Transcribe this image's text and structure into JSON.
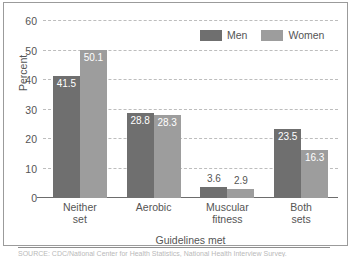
{
  "chart_data": {
    "type": "bar",
    "title": "",
    "xlabel": "Guidelines met",
    "ylabel": "Percent",
    "ylim": [
      0,
      60
    ],
    "yticks": [
      0,
      10,
      20,
      30,
      40,
      50,
      60
    ],
    "grid": true,
    "legend_position": "top-right",
    "categories": [
      "Neither set",
      "Aerobic",
      "Muscular fitness",
      "Both sets"
    ],
    "category_lines": [
      [
        "Neither",
        "set"
      ],
      [
        "Aerobic",
        ""
      ],
      [
        "Muscular",
        "fitness"
      ],
      [
        "Both",
        "sets"
      ]
    ],
    "series": [
      {
        "name": "Men",
        "color": "#6f6f6f",
        "values": [
          41.5,
          28.8,
          3.6,
          23.5
        ]
      },
      {
        "name": "Women",
        "color": "#9d9d9d",
        "values": [
          50.1,
          28.3,
          2.9,
          16.3
        ]
      }
    ]
  },
  "legend": {
    "items": [
      {
        "label": "Men",
        "swatch": "men-swatch"
      },
      {
        "label": "Women",
        "swatch": "women-swatch"
      }
    ]
  },
  "footer": {
    "source_note": "SOURCE: CDC/National Center for Health Statistics, National Health Interview Survey."
  }
}
